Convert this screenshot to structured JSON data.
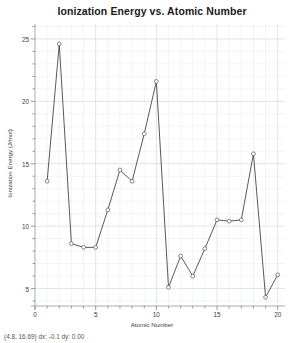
{
  "chart_data": {
    "type": "line",
    "title": "Ionization Energy  vs. Atomic Number",
    "xlabel": "Atomic Number",
    "ylabel": "Ionization Energy (J/mol)",
    "xlim": [
      0,
      20.6
    ],
    "ylim": [
      3.6,
      26.2
    ],
    "xticks": [
      "0",
      "5",
      "10",
      "15",
      "20"
    ],
    "xtick_values": [
      0,
      5,
      10,
      15,
      20
    ],
    "yticks": [
      "5",
      "10",
      "15",
      "20",
      "25"
    ],
    "ytick_values": [
      5,
      10,
      15,
      20,
      25
    ],
    "minor_tick_step": 1,
    "grid": true,
    "legend": "none",
    "marker": "open-circle",
    "line_color": "#3b3b3b",
    "marker_edge_color": "#555555",
    "marker_face_color": "#ffffff",
    "grid_color": "#d8dce4",
    "background_color": "#ffffff",
    "x": [
      1,
      2,
      3,
      4,
      5,
      6,
      7,
      8,
      9,
      10,
      11,
      12,
      13,
      14,
      15,
      16,
      17,
      18,
      19,
      20
    ],
    "values": [
      13.6,
      24.6,
      8.6,
      8.3,
      8.3,
      11.3,
      14.5,
      13.6,
      17.4,
      21.6,
      5.1,
      7.6,
      6.0,
      8.2,
      10.5,
      10.4,
      10.5,
      15.8,
      4.3,
      6.1
    ],
    "series": [
      {
        "name": "Ionization Energy",
        "values": [
          13.6,
          24.6,
          8.6,
          8.3,
          8.3,
          11.3,
          14.5,
          13.6,
          17.4,
          21.6,
          5.1,
          7.6,
          6.0,
          8.2,
          10.5,
          10.4,
          10.5,
          15.8,
          4.3,
          6.1
        ]
      }
    ]
  },
  "status": {
    "readout": "(4.8, 16.69) dx: -0.1 dy: 0.00"
  }
}
